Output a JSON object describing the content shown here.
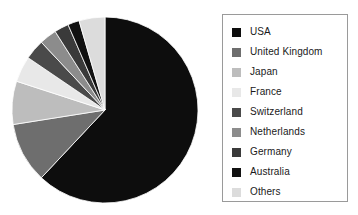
{
  "chart_data": {
    "type": "pie",
    "title": "",
    "subtitle": "",
    "xlabel": "",
    "ylabel": "",
    "grid": false,
    "legend_position": "right",
    "start_angle_deg": 0,
    "direction": "clockwise",
    "center": {
      "x": 105,
      "y": 110
    },
    "radius": 93,
    "categories": [
      "USA",
      "United Kingdom",
      "Japan",
      "France",
      "Switzerland",
      "Netherlands",
      "Germany",
      "Australia",
      "Others"
    ],
    "values": [
      62.0,
      10.5,
      7.5,
      4.5,
      3.5,
      3.0,
      2.5,
      2.0,
      4.5
    ],
    "colors": [
      "#0d0d0d",
      "#6e6e6e",
      "#bdbdbd",
      "#e8e8e8",
      "#4a4a4a",
      "#8c8c8c",
      "#3a3a3a",
      "#111111",
      "#dcdcdc"
    ],
    "slices": [
      {
        "label": "USA",
        "value": 62.0,
        "color": "#0d0d0d"
      },
      {
        "label": "United Kingdom",
        "value": 10.5,
        "color": "#6e6e6e"
      },
      {
        "label": "Japan",
        "value": 7.5,
        "color": "#bdbdbd"
      },
      {
        "label": "France",
        "value": 4.5,
        "color": "#e8e8e8"
      },
      {
        "label": "Switzerland",
        "value": 3.5,
        "color": "#4a4a4a"
      },
      {
        "label": "Netherlands",
        "value": 3.0,
        "color": "#8c8c8c"
      },
      {
        "label": "Germany",
        "value": 2.5,
        "color": "#3a3a3a"
      },
      {
        "label": "Australia",
        "value": 2.0,
        "color": "#111111"
      },
      {
        "label": "Others",
        "value": 4.5,
        "color": "#dcdcdc"
      }
    ]
  },
  "legend": {
    "border_color": "#9a9a9a",
    "items": [
      {
        "label": "USA",
        "color": "#0d0d0d"
      },
      {
        "label": "United Kingdom",
        "color": "#6e6e6e"
      },
      {
        "label": "Japan",
        "color": "#bdbdbd"
      },
      {
        "label": "France",
        "color": "#e8e8e8"
      },
      {
        "label": "Switzerland",
        "color": "#4a4a4a"
      },
      {
        "label": "Netherlands",
        "color": "#8c8c8c"
      },
      {
        "label": "Germany",
        "color": "#3a3a3a"
      },
      {
        "label": "Australia",
        "color": "#111111"
      },
      {
        "label": "Others",
        "color": "#dcdcdc"
      }
    ]
  }
}
